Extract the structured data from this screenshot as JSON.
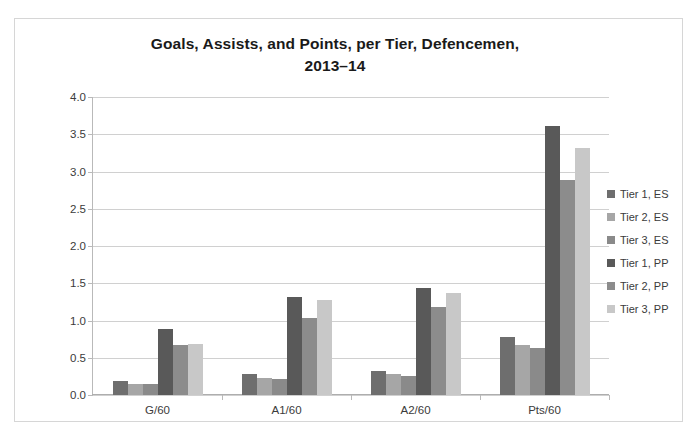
{
  "chart_data": {
    "type": "bar",
    "title": "Goals, Assists, and Points, per Tier, Defencemen, 2013–14",
    "title_line1": "Goals, Assists, and Points, per Tier, Defencemen,",
    "title_line2": "2013–14",
    "xlabel": "",
    "ylabel": "",
    "ylim": [
      0,
      4.0
    ],
    "ytick_step": 0.5,
    "ytick_labels": [
      "0.0",
      "0.5",
      "1.0",
      "1.5",
      "2.0",
      "2.5",
      "3.0",
      "3.5",
      "4.0"
    ],
    "ytick_values": [
      0,
      0.5,
      1.0,
      1.5,
      2.0,
      2.5,
      3.0,
      3.5,
      4.0
    ],
    "grid": true,
    "legend_position": "right",
    "categories": [
      "G/60",
      "A1/60",
      "A2/60",
      "Pts/60"
    ],
    "series": [
      {
        "name": "Tier 1, ES",
        "color": "#6e6e6e",
        "values": [
          0.19,
          0.28,
          0.32,
          0.78
        ]
      },
      {
        "name": "Tier 2, ES",
        "color": "#a6a6a6",
        "values": [
          0.15,
          0.23,
          0.28,
          0.67
        ]
      },
      {
        "name": "Tier 3, ES",
        "color": "#8a8a8a",
        "values": [
          0.15,
          0.21,
          0.25,
          0.63
        ]
      },
      {
        "name": "Tier 1, PP",
        "color": "#595959",
        "values": [
          0.88,
          1.31,
          1.43,
          3.61
        ]
      },
      {
        "name": "Tier 2, PP",
        "color": "#8c8c8c",
        "values": [
          0.67,
          1.03,
          1.18,
          2.88
        ]
      },
      {
        "name": "Tier 3, PP",
        "color": "#c8c8c8",
        "values": [
          0.68,
          1.27,
          1.37,
          3.31
        ]
      }
    ]
  }
}
